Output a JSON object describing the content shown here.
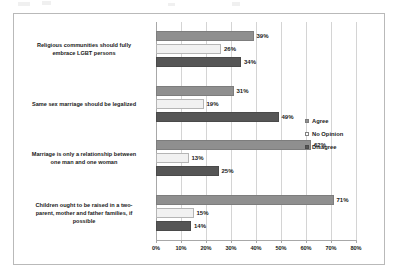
{
  "chart_data": {
    "type": "bar",
    "orientation": "horizontal",
    "title": "",
    "xlabel": "",
    "ylabel": "",
    "xlim": [
      0,
      80
    ],
    "xtick_labels": [
      "0%",
      "10%",
      "20%",
      "30%",
      "40%",
      "50%",
      "60%",
      "70%",
      "80%"
    ],
    "xtick_values": [
      0,
      10,
      20,
      30,
      40,
      50,
      60,
      70,
      80
    ],
    "grid": true,
    "legend_position": "right",
    "categories": [
      "Religious communities should fully embrace LGBT persons",
      "Same sex marriage should be legalized",
      "Marriage is only a relationship between one man and one woman",
      "Children ought to be raised in a two-parent,  mother and father families, if possible"
    ],
    "category_lines": [
      [
        "Religious communities should fully",
        "embrace LGBT persons"
      ],
      [
        "Same sex marriage should be legalized"
      ],
      [
        "Marriage is only a relationship between",
        "one man and one woman"
      ],
      [
        "Children ought to be raised in a two-",
        "parent,  mother and father families, if",
        "possible"
      ]
    ],
    "series": [
      {
        "name": "Agree",
        "color": "#8f8f8f",
        "values": [
          39,
          31,
          62,
          71
        ],
        "labels": [
          "39%",
          "31%",
          "62%",
          "71%"
        ]
      },
      {
        "name": "No Opinion",
        "color": "#f1f1f1",
        "values": [
          26,
          19,
          13,
          15
        ],
        "labels": [
          "26%",
          "19%",
          "13%",
          "15%"
        ]
      },
      {
        "name": "Disagree",
        "color": "#565656",
        "values": [
          34,
          49,
          25,
          14
        ],
        "labels": [
          "34%",
          "49%",
          "25%",
          "14%"
        ]
      }
    ]
  },
  "legend": {
    "items": [
      {
        "label": "Agree"
      },
      {
        "label": "No Opinion"
      },
      {
        "label": "Disagree"
      }
    ]
  }
}
